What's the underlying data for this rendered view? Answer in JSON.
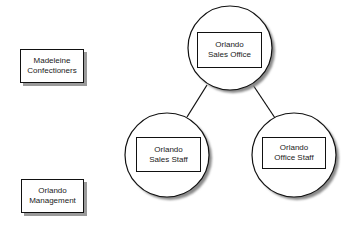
{
  "diagram": {
    "type": "hierarchy",
    "standalone_entities": [
      {
        "id": "madeleine",
        "line1": "Madeleine",
        "line2": "Confectioners"
      },
      {
        "id": "orlando-management",
        "line1": "Orlando",
        "line2": "Management"
      }
    ],
    "nodes": [
      {
        "id": "sales-office",
        "line1": "Orlando",
        "line2": "Sales Office",
        "shape": "circle"
      },
      {
        "id": "sales-staff",
        "line1": "Orlando",
        "line2": "Sales Staff",
        "shape": "circle"
      },
      {
        "id": "office-staff",
        "line1": "Orlando",
        "line2": "Office Staff",
        "shape": "circle"
      }
    ],
    "edges": [
      {
        "from": "sales-office",
        "to": "sales-staff"
      },
      {
        "from": "sales-office",
        "to": "office-staff"
      }
    ],
    "colors": {
      "stroke": "#111111",
      "shadow": "#9a9a9a",
      "fill": "#ffffff"
    }
  }
}
